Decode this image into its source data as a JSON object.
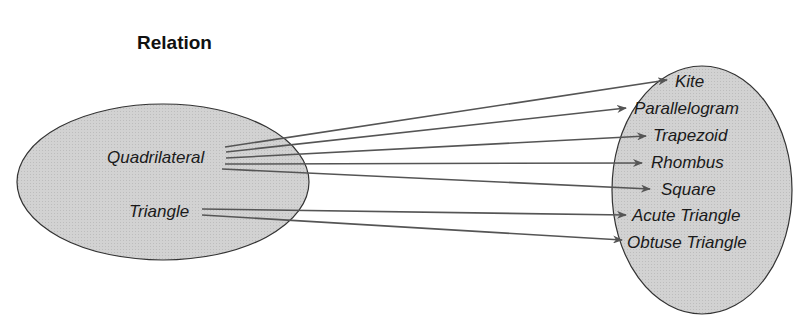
{
  "title": "Relation",
  "domain_set": {
    "items": [
      "Quadrilateral",
      "Triangle"
    ]
  },
  "range_set": {
    "items": [
      "Kite",
      "Parallelogram",
      "Trapezoid",
      "Rhombus",
      "Square",
      "Acute Triangle",
      "Obtuse Triangle"
    ]
  },
  "mappings": [
    {
      "from": "Quadrilateral",
      "to": "Kite"
    },
    {
      "from": "Quadrilateral",
      "to": "Parallelogram"
    },
    {
      "from": "Quadrilateral",
      "to": "Trapezoid"
    },
    {
      "from": "Quadrilateral",
      "to": "Rhombus"
    },
    {
      "from": "Quadrilateral",
      "to": "Square"
    },
    {
      "from": "Triangle",
      "to": "Acute Triangle"
    },
    {
      "from": "Triangle",
      "to": "Obtuse Triangle"
    }
  ],
  "colors": {
    "ellipse_fill": "#cfcfcf",
    "stroke": "#333333",
    "arrow": "#555555"
  }
}
